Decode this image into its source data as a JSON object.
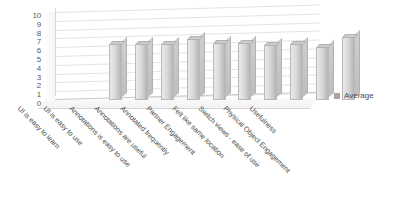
{
  "chart_data": {
    "type": "bar",
    "title": "",
    "subtitle": "",
    "xlabel": "",
    "ylabel": "",
    "ylim": [
      0,
      10
    ],
    "ytick_step": 1,
    "yticks": [
      "10",
      "9",
      "8",
      "7",
      "6",
      "5",
      "4",
      "3",
      "2",
      "1",
      "0"
    ],
    "grid": true,
    "three_d": true,
    "legend_position": "right",
    "legend": [
      "Average"
    ],
    "categories": [
      "UI is easy to learn",
      "UI is easy to use",
      "Annotations is easy to use",
      "Annotations are useful",
      "Annotated frequently",
      "Partner Engagement",
      "Felt like same location",
      "Switch views - ease of use",
      "Physical Object Engagement",
      "Usefulness"
    ],
    "series": [
      {
        "name": "Average",
        "color": "#c4c4c4",
        "values": [
          6.4,
          6.4,
          6.4,
          6.9,
          6.5,
          6.5,
          6.2,
          6.4,
          6.0,
          7.2
        ]
      }
    ]
  },
  "legend": {
    "items": [
      {
        "label": "Average",
        "color": "#a6a6a6"
      }
    ]
  },
  "colors": {
    "bar_fill": "#c4c4c4",
    "bar_edge": "#b9b9b9",
    "gridline": "#e3e3e3",
    "axis_text": "#595959",
    "label_text": "#4a4a4a",
    "background": "#ffffff"
  }
}
